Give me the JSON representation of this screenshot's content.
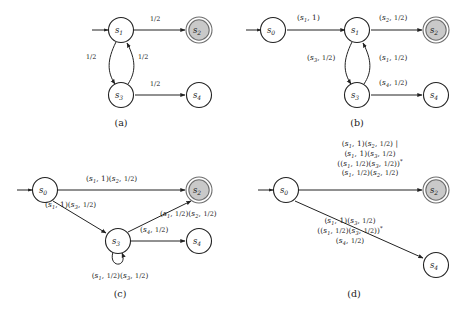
{
  "figure": {
    "captions": {
      "a": "(a)",
      "b": "(b)",
      "c": "(c)",
      "d": "(d)"
    }
  },
  "colors": {
    "stroke": "#222222",
    "accept_fill": "#c9c9c9",
    "accept_stroke": "#6e6e6e",
    "node_fill": "#ffffff",
    "background": "#ffffff",
    "text": "#1a1a1a"
  },
  "panel_a": {
    "caption": "(a)",
    "nodes": [
      {
        "id": "s1",
        "label": "s",
        "sub": "1",
        "accepting": false,
        "start": true
      },
      {
        "id": "s2",
        "label": "s",
        "sub": "2",
        "accepting": true,
        "start": false
      },
      {
        "id": "s3",
        "label": "s",
        "sub": "3",
        "accepting": false,
        "start": false
      },
      {
        "id": "s4",
        "label": "s",
        "sub": "4",
        "accepting": false,
        "start": false
      }
    ],
    "edges": [
      {
        "from": "s1",
        "to": "s2",
        "label": "1/2"
      },
      {
        "from": "s1",
        "to": "s3",
        "label": "1/2"
      },
      {
        "from": "s3",
        "to": "s1",
        "label": "1/2"
      },
      {
        "from": "s3",
        "to": "s4",
        "label": "1/2"
      }
    ]
  },
  "panel_b": {
    "caption": "(b)",
    "nodes": [
      {
        "id": "s0",
        "label": "s",
        "sub": "0",
        "accepting": false,
        "start": true
      },
      {
        "id": "s1",
        "label": "s",
        "sub": "1",
        "accepting": false,
        "start": false
      },
      {
        "id": "s2",
        "label": "s",
        "sub": "2",
        "accepting": true,
        "start": false
      },
      {
        "id": "s3",
        "label": "s",
        "sub": "3",
        "accepting": false,
        "start": false
      },
      {
        "id": "s4",
        "label": "s",
        "sub": "4",
        "accepting": false,
        "start": false
      }
    ],
    "edges": [
      {
        "from": "s0",
        "to": "s1",
        "label": "(s1, 1)"
      },
      {
        "from": "s1",
        "to": "s2",
        "label": "(s2, 1/2)"
      },
      {
        "from": "s1",
        "to": "s3",
        "label": "(s3, 1/2)"
      },
      {
        "from": "s3",
        "to": "s1",
        "label": "(s1, 1/2)"
      },
      {
        "from": "s3",
        "to": "s4",
        "label": "(s4, 1/2)"
      }
    ]
  },
  "panel_c": {
    "caption": "(c)",
    "nodes": [
      {
        "id": "s0",
        "label": "s",
        "sub": "0",
        "accepting": false,
        "start": true
      },
      {
        "id": "s2",
        "label": "s",
        "sub": "2",
        "accepting": true,
        "start": false
      },
      {
        "id": "s3",
        "label": "s",
        "sub": "3",
        "accepting": false,
        "start": false
      },
      {
        "id": "s4",
        "label": "s",
        "sub": "4",
        "accepting": false,
        "start": false
      }
    ],
    "edges": [
      {
        "from": "s0",
        "to": "s2",
        "label": "(s1, 1)(s2, 1/2)"
      },
      {
        "from": "s0",
        "to": "s3",
        "label": "(s1, 1)(s3, 1/2)"
      },
      {
        "from": "s3",
        "to": "s2",
        "label": "(s1, 1/2)(s2, 1/2)"
      },
      {
        "from": "s3",
        "to": "s4",
        "label": "(s4, 1/2)"
      },
      {
        "from": "s3",
        "to": "s3",
        "label": "(s1, 1/2)(s3, 1/2)"
      }
    ]
  },
  "panel_d": {
    "caption": "(d)",
    "nodes": [
      {
        "id": "s0",
        "label": "s",
        "sub": "0",
        "accepting": false,
        "start": true
      },
      {
        "id": "s2",
        "label": "s",
        "sub": "2",
        "accepting": true,
        "start": false
      },
      {
        "id": "s4",
        "label": "s",
        "sub": "4",
        "accepting": false,
        "start": false
      }
    ],
    "edges": [
      {
        "from": "s0",
        "to": "s2",
        "lines": [
          "(s1, 1)(s2, 1/2) |",
          "(s1, 1)(s3, 1/2)",
          "((s1, 1/2)(s3, 1/2))*",
          "(s1, 1/2)(s2, 1/2)"
        ]
      },
      {
        "from": "s0",
        "to": "s4",
        "lines": [
          "(s1, 1)(s3, 1/2)",
          "((s1, 1/2)(s3, 1/2))*",
          "(s4, 1/2)"
        ]
      }
    ]
  }
}
